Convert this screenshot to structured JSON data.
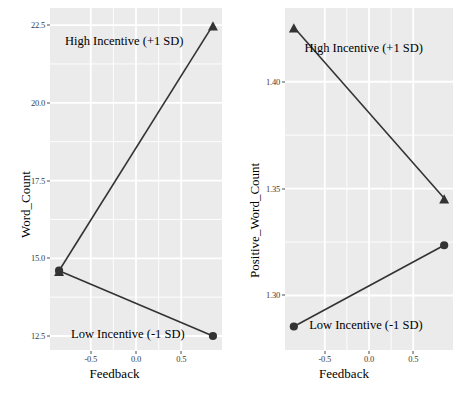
{
  "figure": {
    "width": 459,
    "height": 394,
    "background": "#ffffff",
    "panel_background": "#ebebeb",
    "gridline_color": "#ffffff",
    "line_color": "#333333",
    "text_color": "#000000"
  },
  "chart_data": [
    {
      "id": "left",
      "type": "line",
      "title": "",
      "xlabel": "Feedback",
      "ylabel": "Word_Count",
      "xlim": [
        -0.95,
        0.95
      ],
      "ylim": [
        12.05,
        23.05
      ],
      "xticks": [
        -0.5,
        0.0,
        0.5
      ],
      "xticklabels": [
        "-0.5",
        "0.0",
        "0.5"
      ],
      "yticks": [
        12.5,
        15.0,
        17.5,
        20.0,
        22.5
      ],
      "yticklabels": [
        "12.5",
        "15.0",
        "17.5",
        "20.0",
        "22.5"
      ],
      "grid": true,
      "legend": "annotations",
      "x": [
        -0.85,
        0.85
      ],
      "series": [
        {
          "name": "High Incentive (+1 SD)",
          "marker": "triangle",
          "values": [
            14.6,
            22.5
          ]
        },
        {
          "name": "Low Incentive (-1 SD)",
          "marker": "circle",
          "values": [
            14.6,
            12.5
          ]
        }
      ],
      "annotations": [
        {
          "text": "High Incentive (+1 SD)",
          "x": -0.13,
          "y": 21.95
        },
        {
          "text": "Low Incentive (-1 SD)",
          "x": -0.09,
          "y": 12.52
        }
      ]
    },
    {
      "id": "right",
      "type": "line",
      "title": "",
      "xlabel": "Feedback",
      "ylabel": "Positive_Word_Count",
      "xlim": [
        -0.95,
        0.95
      ],
      "ylim": [
        1.2745,
        1.4345
      ],
      "xticks": [
        -0.5,
        0.0,
        0.5
      ],
      "xticklabels": [
        "-0.5",
        "0.0",
        "0.5"
      ],
      "yticks": [
        1.3,
        1.35,
        1.4
      ],
      "yticklabels": [
        "1.30",
        "1.35",
        "1.40"
      ],
      "grid": true,
      "legend": "annotations",
      "x": [
        -0.85,
        0.85
      ],
      "series": [
        {
          "name": "High Incentive (+1 SD)",
          "marker": "triangle",
          "values": [
            1.4255,
            1.3455
          ]
        },
        {
          "name": "Low Incentive (-1 SD)",
          "marker": "circle",
          "values": [
            1.2855,
            1.3235
          ]
        }
      ],
      "annotations": [
        {
          "text": "High Incentive (+1 SD)",
          "x": -0.06,
          "y": 1.4155
        },
        {
          "text": "Low Incentive (-1 SD)",
          "x": -0.035,
          "y": 1.2855
        }
      ]
    }
  ]
}
